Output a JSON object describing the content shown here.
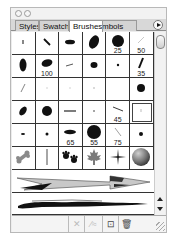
{
  "window": {
    "controls": [
      "close",
      "minimize"
    ]
  },
  "tabs": [
    {
      "label": "Styles",
      "active": false
    },
    {
      "label": "Swatches",
      "active": false
    },
    {
      "label": "Brushes",
      "active": true
    },
    {
      "label": "Symbols",
      "active": false
    }
  ],
  "tab_display": {
    "styles": "Styles",
    "swatches": "Swatches",
    "brushes": "Brushes",
    "symbols": "mbols"
  },
  "panel_menu": {
    "icon": "flyout-menu-icon"
  },
  "brushes": {
    "rows": [
      [
        {
          "type": "calligraphic",
          "shape": "dot-tiny",
          "size": ""
        },
        {
          "type": "calligraphic",
          "shape": "diagonal-line",
          "size": ""
        },
        {
          "type": "calligraphic",
          "shape": "flat-oval",
          "size": ""
        },
        {
          "type": "calligraphic",
          "shape": "tilted-oval-large",
          "size": ""
        },
        {
          "type": "scatter",
          "shape": "round-large",
          "size": "25"
        },
        {
          "type": "calligraphic",
          "shape": "thin-line-light",
          "size": "50"
        }
      ],
      [
        {
          "type": "calligraphic",
          "shape": "vertical-oval",
          "size": ""
        },
        {
          "type": "scatter",
          "shape": "oval-medium",
          "size": "100"
        },
        {
          "type": "calligraphic",
          "shape": "short-stroke",
          "size": ""
        },
        {
          "type": "calligraphic",
          "shape": "round-small",
          "size": ""
        },
        {
          "type": "calligraphic",
          "shape": "dot-small",
          "size": ""
        },
        {
          "type": "calligraphic",
          "shape": "slanted-stroke",
          "size": "35"
        }
      ],
      [
        {
          "type": "calligraphic",
          "shape": "light-slash",
          "size": ""
        },
        {
          "type": "calligraphic",
          "shape": "faint-dot",
          "size": ""
        },
        {
          "type": "calligraphic",
          "shape": "faint-dot",
          "size": ""
        },
        {
          "type": "calligraphic",
          "shape": "faint-dot",
          "size": ""
        },
        {
          "type": "calligraphic",
          "shape": "empty",
          "size": ""
        },
        {
          "type": "calligraphic",
          "shape": "round-medium",
          "size": ""
        }
      ],
      [
        {
          "type": "calligraphic",
          "shape": "tilted-oval",
          "size": ""
        },
        {
          "type": "calligraphic",
          "shape": "round-large",
          "size": ""
        },
        {
          "type": "calligraphic",
          "shape": "horizontal-line",
          "size": ""
        },
        {
          "type": "calligraphic",
          "shape": "dot-tiny",
          "size": ""
        },
        {
          "type": "calligraphic",
          "shape": "slanted-line",
          "size": "45"
        },
        {
          "type": "calligraphic",
          "shape": "faint-dot",
          "size": "",
          "selected": true
        }
      ],
      [
        {
          "type": "calligraphic",
          "shape": "dash-small",
          "size": ""
        },
        {
          "type": "calligraphic",
          "shape": "dot-small",
          "size": ""
        },
        {
          "type": "scatter",
          "shape": "flat-oval-wide",
          "size": "65"
        },
        {
          "type": "scatter",
          "shape": "round-xlarge",
          "size": "55"
        },
        {
          "type": "calligraphic",
          "shape": "light-diagonal",
          "size": "75"
        },
        {
          "type": "calligraphic",
          "shape": "dot-small",
          "size": ""
        }
      ],
      [
        {
          "type": "art",
          "shape": "bone",
          "size": ""
        },
        {
          "type": "art",
          "shape": "vertical-stick",
          "size": ""
        },
        {
          "type": "scatter",
          "shape": "paw-prints",
          "size": ""
        },
        {
          "type": "scatter",
          "shape": "maple-leaf",
          "size": ""
        },
        {
          "type": "scatter",
          "shape": "sparkle-star",
          "size": ""
        },
        {
          "type": "scatter",
          "shape": "sphere",
          "size": ""
        }
      ]
    ],
    "strokes": [
      {
        "type": "art",
        "shape": "arrow"
      },
      {
        "type": "art",
        "shape": "charcoal-brush-stroke"
      }
    ]
  },
  "bottom_toolbar": [
    {
      "name": "remove-brush-stroke",
      "icon": "x-icon",
      "label": "✕",
      "enabled": false
    },
    {
      "name": "brush-options",
      "icon": "options-icon",
      "label": "⁄≈",
      "enabled": false
    },
    {
      "name": "new-brush",
      "icon": "new-page-icon",
      "label": "⊡",
      "enabled": true
    },
    {
      "name": "delete-brush",
      "icon": "trash-icon",
      "label": "🗑",
      "enabled": true
    }
  ],
  "colors": {
    "panel_bg": "#ececec",
    "grid_line": "#333333",
    "active_tab": "#ffffff",
    "inactive_tab": "#d4d4d4"
  }
}
